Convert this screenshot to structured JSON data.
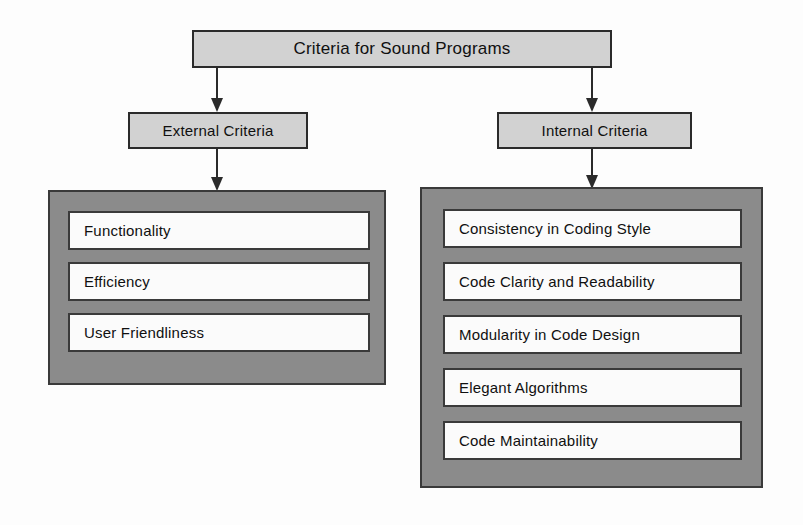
{
  "diagram": {
    "title": "Criteria for Sound Programs",
    "type": "hierarchy-tree",
    "root": {
      "label": "Criteria for Sound Programs"
    },
    "branches": [
      {
        "id": "external",
        "label": "External Criteria",
        "items": [
          "Functionality",
          "Efficiency",
          "User Friendliness"
        ]
      },
      {
        "id": "internal",
        "label": "Internal Criteria",
        "items": [
          "Consistency in Coding Style",
          "Code Clarity and Readability",
          "Modularity in Code Design",
          "Elegant Algorithms",
          "Code Maintainability"
        ]
      }
    ],
    "colors": {
      "node_fill": "#d2d2d2",
      "node_border": "#2b2b2b",
      "group_fill": "#8b8b8b",
      "group_border": "#3a3a3a",
      "leaf_fill": "#fbfbfb",
      "leaf_border": "#3a3a3a",
      "connector": "#2b2b2b",
      "background": "#fdfdfd",
      "text": "#101010"
    }
  }
}
